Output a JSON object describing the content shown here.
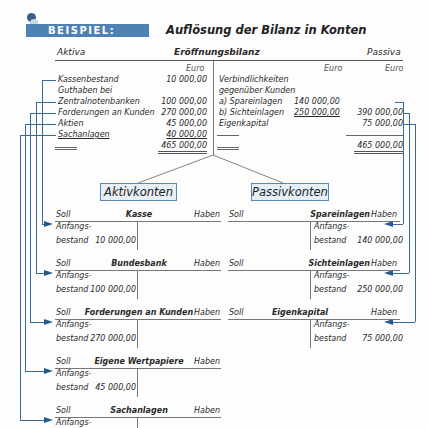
{
  "header": {
    "badge": "BEISPIEL:",
    "title": "Auflösung der Bilanz in Konten"
  },
  "balance": {
    "left_label": "Aktiva",
    "title": "Eröffnungsbilanz",
    "right_label": "Passiva",
    "currency": "Euro",
    "aktiva": [
      {
        "label": "Kassenbestand",
        "value": "10 000,00"
      },
      {
        "label": "Guthaben bei",
        "value": ""
      },
      {
        "label": "Zentralnotenbanken",
        "value": "100 000,00"
      },
      {
        "label": "Forderungen an Kunden",
        "value": "270 000,00"
      },
      {
        "label": "Aktien",
        "value": "45 000,00"
      },
      {
        "label": "Sachanlagen",
        "value": "40 000,00"
      }
    ],
    "aktiva_total": "465 000,00",
    "passiva": [
      {
        "label": "Verbindlichkeiten",
        "sub": "",
        "value": ""
      },
      {
        "label": "gegenüber Kunden",
        "sub": "",
        "value": ""
      },
      {
        "label": "a) Spareinlagen",
        "sub": "140 000,00",
        "value": ""
      },
      {
        "label": "b) Sichteinlagen",
        "sub": "250 000,00",
        "value": "390 000,00"
      },
      {
        "label": "Eigenkapital",
        "sub": "",
        "value": "75 000,00"
      }
    ],
    "passiva_total": "465 000,00"
  },
  "groups": {
    "aktiv": "Aktivkonten",
    "passiv": "Passivkonten"
  },
  "account_labels": {
    "soll": "Soll",
    "haben": "Haben",
    "anfangs": "Anfangs-",
    "bestand": "bestand"
  },
  "aktiv_accounts": [
    {
      "name": "Kasse",
      "opening": "10 000,00"
    },
    {
      "name": "Bundesbank",
      "opening": "100 000,00"
    },
    {
      "name": "Forderungen an Kunden",
      "opening": "270 000,00"
    },
    {
      "name": "Eigene Wertpapiere",
      "opening": "45 000,00"
    },
    {
      "name": "Sachanlagen",
      "opening": "40 000,00"
    }
  ],
  "passiv_accounts": [
    {
      "name": "Spareinlagen",
      "opening": "140 000,00"
    },
    {
      "name": "Sichteinlagen",
      "opening": "250 000,00"
    },
    {
      "name": "Eigenkapital",
      "opening": "75 000,00"
    }
  ],
  "colors": {
    "accent": "#4f82b4",
    "box_fill": "#e6eef6",
    "arrow": "#2a5a8c"
  }
}
